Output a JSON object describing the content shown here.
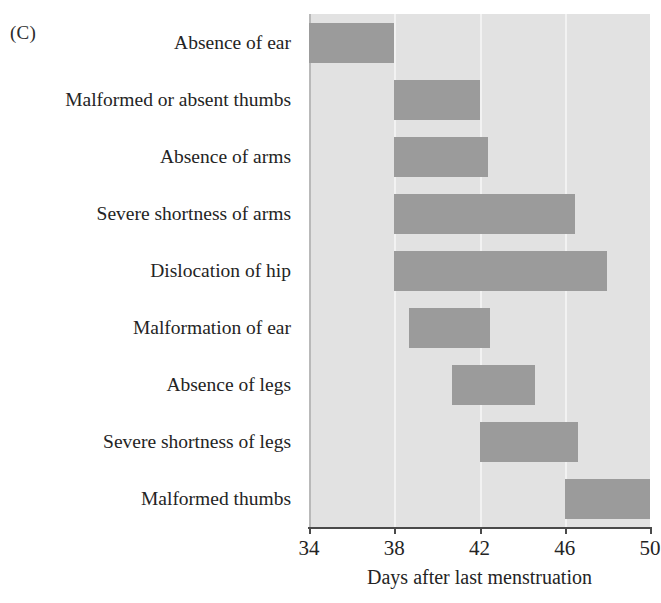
{
  "figure": {
    "panel_label": "(C)",
    "x_axis_title": "Days after last menstruation"
  },
  "chart_data": {
    "type": "bar",
    "orientation": "horizontal",
    "subtype": "range-bar",
    "title": "",
    "panel": "(C)",
    "xlabel": "Days after last menstruation",
    "ylabel": "",
    "xlim": [
      34,
      50
    ],
    "xticks": [
      34,
      38,
      42,
      46,
      50
    ],
    "xticklabels": [
      "34",
      "38",
      "42",
      "46",
      "50"
    ],
    "grid": true,
    "gridlines_at": [
      38,
      42,
      46
    ],
    "legend": "none",
    "bar_color": "#9b9b9b",
    "plot_background": "#e2e2e2",
    "categories": [
      "Absence of ear",
      "Malformed or absent thumbs",
      "Absence of arms",
      "Severe shortness of arms",
      "Dislocation of hip",
      "Malformation of ear",
      "Absence of legs",
      "Severe shortness of legs",
      "Malformed thumbs"
    ],
    "ranges": [
      {
        "category": "Absence of ear",
        "start": 34.0,
        "end": 38.0
      },
      {
        "category": "Malformed or absent thumbs",
        "start": 38.0,
        "end": 42.0
      },
      {
        "category": "Absence of arms",
        "start": 38.0,
        "end": 42.4
      },
      {
        "category": "Severe shortness of arms",
        "start": 38.0,
        "end": 46.5
      },
      {
        "category": "Dislocation of hip",
        "start": 38.0,
        "end": 48.0
      },
      {
        "category": "Malformation of ear",
        "start": 38.7,
        "end": 42.5
      },
      {
        "category": "Absence of legs",
        "start": 40.7,
        "end": 44.6
      },
      {
        "category": "Severe shortness of legs",
        "start": 42.0,
        "end": 46.6
      },
      {
        "category": "Malformed thumbs",
        "start": 46.0,
        "end": 50.0
      }
    ]
  },
  "axis": {
    "ticks": [
      {
        "label": "34",
        "value": 34
      },
      {
        "label": "38",
        "value": 38
      },
      {
        "label": "42",
        "value": 42
      },
      {
        "label": "46",
        "value": 46
      },
      {
        "label": "50",
        "value": 50
      }
    ]
  }
}
